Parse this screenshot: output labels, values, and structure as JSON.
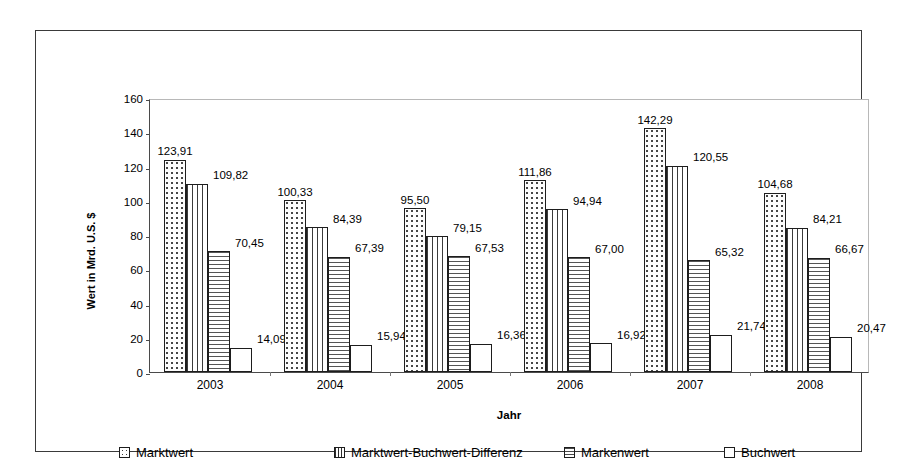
{
  "chart_data": {
    "type": "bar",
    "title": "",
    "xlabel": "Jahr",
    "ylabel": "Wert in Mrd. U.S. $",
    "categories": [
      "2003",
      "2004",
      "2005",
      "2006",
      "2007",
      "2008"
    ],
    "ylim": [
      0,
      160
    ],
    "yticks": [
      0,
      20,
      40,
      60,
      80,
      100,
      120,
      140,
      160
    ],
    "ytick_labels": [
      "0",
      "20",
      "40",
      "60",
      "80",
      "100",
      "120",
      "140",
      "160"
    ],
    "grid": false,
    "legend_position": "bottom",
    "series": [
      {
        "name": "Marktwert",
        "pattern": "dots",
        "values": [
          123.91,
          100.33,
          95.5,
          111.86,
          142.29,
          104.68
        ],
        "labels": [
          "123,91",
          "100,33",
          "95,50",
          "111,86",
          "142,29",
          "104,68"
        ]
      },
      {
        "name": "Marktwert-Buchwert-Differenz",
        "pattern": "vertical-lines",
        "values": [
          109.82,
          84.39,
          79.15,
          94.94,
          120.55,
          84.21
        ],
        "labels": [
          "109,82",
          "84,39",
          "79,15",
          "94,94",
          "120,55",
          "84,21"
        ]
      },
      {
        "name": "Markenwert",
        "pattern": "horizontal-lines",
        "values": [
          70.45,
          67.39,
          67.53,
          67.0,
          65.32,
          66.67
        ],
        "labels": [
          "70,45",
          "67,39",
          "67,53",
          "67,00",
          "65,32",
          "66,67"
        ]
      },
      {
        "name": "Buchwert",
        "pattern": "solid-white",
        "values": [
          14.09,
          15.94,
          16.36,
          16.92,
          21.74,
          20.47
        ],
        "labels": [
          "14,09",
          "15,94",
          "16,36",
          "16,92",
          "21,74",
          "20,47"
        ]
      }
    ]
  },
  "legend": {
    "items": [
      {
        "label": "Marktwert",
        "pattern": "dots"
      },
      {
        "label": "Marktwert-Buchwert-Differenz",
        "pattern": "vertical-lines"
      },
      {
        "label": "Markenwert",
        "pattern": "horizontal-lines"
      },
      {
        "label": "Buchwert",
        "pattern": "solid-white"
      }
    ]
  }
}
